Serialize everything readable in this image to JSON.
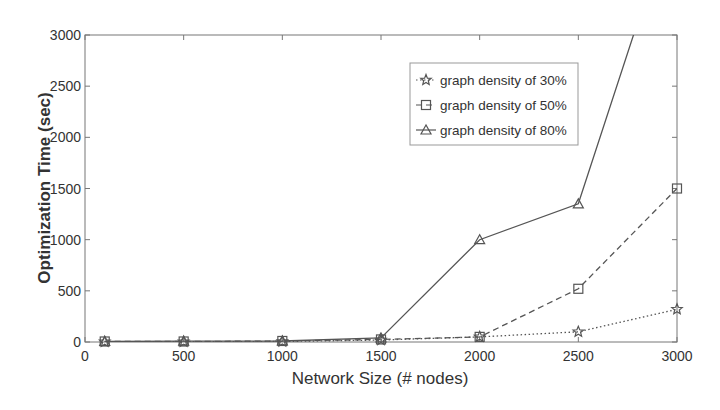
{
  "chart_data": {
    "type": "line",
    "title": "",
    "xlabel": "Network Size (# nodes)",
    "ylabel": "Optimization Time (sec)",
    "xlim": [
      0,
      3000
    ],
    "ylim": [
      0,
      3000
    ],
    "xticks": [
      0,
      500,
      1000,
      1500,
      2000,
      2500,
      3000
    ],
    "yticks": [
      0,
      500,
      1000,
      1500,
      2000,
      2500,
      3000
    ],
    "grid": false,
    "legend_position": "upper right (inside)",
    "x": [
      100,
      500,
      1000,
      1500,
      2000,
      2500,
      3000
    ],
    "series": [
      {
        "name": "graph density of 30%",
        "marker": "star",
        "linestyle": "dotted",
        "values": [
          2,
          3,
          5,
          20,
          50,
          100,
          320
        ]
      },
      {
        "name": "graph density of 50%",
        "marker": "square",
        "linestyle": "dashed",
        "values": [
          5,
          5,
          10,
          25,
          50,
          520,
          1500
        ]
      },
      {
        "name": "graph density of 80%",
        "marker": "triangle",
        "linestyle": "solid",
        "values": [
          5,
          8,
          10,
          40,
          1000,
          1350,
          4300
        ]
      }
    ]
  },
  "colors": {
    "axis": "#777777",
    "line": "#555555",
    "text": "#333333"
  }
}
